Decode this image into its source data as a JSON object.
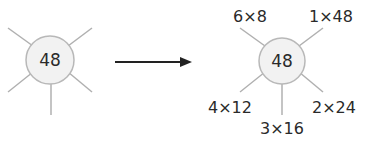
{
  "left": {
    "center_value": "48"
  },
  "right": {
    "center_value": "48",
    "factor_pairs": {
      "top_left": "6×8",
      "top_right": "1×48",
      "bottom_left": "4×12",
      "bottom": "3×16",
      "bottom_right": "2×24"
    }
  },
  "colors": {
    "line": "#b0b0b0",
    "circle_fill": "#f2f2f2",
    "circle_stroke": "#b8b8b8",
    "arrow": "#222222",
    "text": "#2a2a2a"
  }
}
